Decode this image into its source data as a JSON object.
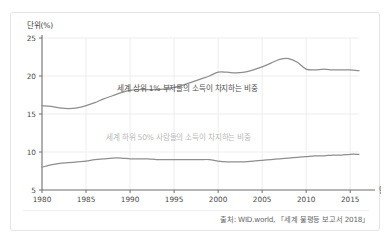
{
  "figure": {
    "unit_y_label": "단위(%)",
    "unit_x_label": "단위(년)",
    "source": "출처: WID.world, 「세계 불평등 보고서 2018」",
    "line_color": "#8e8e8e",
    "grid_color": "#ededed",
    "axis_color": "#6f6f6f",
    "border_color": "#e3e3e3",
    "annotation_top_color": "#4f4f4f",
    "annotation_bottom_color": "#b9b9b9"
  },
  "chart_data": {
    "type": "line",
    "title": "",
    "xlabel": "단위(년)",
    "ylabel": "단위(%)",
    "xlim": [
      1980,
      2016
    ],
    "ylim": [
      5,
      25
    ],
    "yticks": [
      5,
      10,
      15,
      20,
      25
    ],
    "xticks": [
      1980,
      1985,
      1990,
      1995,
      2000,
      2005,
      2010,
      2015
    ],
    "grid": true,
    "legend": "annotations-inline",
    "x": [
      1980,
      1981,
      1982,
      1983,
      1984,
      1985,
      1986,
      1987,
      1988,
      1989,
      1990,
      1991,
      1992,
      1993,
      1994,
      1995,
      1996,
      1997,
      1998,
      1999,
      2000,
      2001,
      2002,
      2003,
      2004,
      2005,
      2006,
      2007,
      2008,
      2009,
      2010,
      2011,
      2012,
      2013,
      2014,
      2015,
      2016
    ],
    "series": [
      {
        "name": "세계 상위 1% 부자들의 소득이 차지하는 비중",
        "values": [
          16.1,
          16.0,
          15.8,
          15.7,
          15.8,
          16.1,
          16.5,
          17.0,
          17.4,
          17.8,
          18.1,
          18.2,
          18.2,
          18.2,
          18.3,
          18.5,
          18.8,
          19.2,
          19.6,
          20.0,
          20.5,
          20.5,
          20.4,
          20.5,
          20.8,
          21.2,
          21.7,
          22.2,
          22.3,
          21.8,
          20.9,
          20.8,
          20.9,
          20.8,
          20.8,
          20.8,
          20.7
        ]
      },
      {
        "name": "세계 하위 50% 사람들의 소득이 차지하는 비중",
        "values": [
          8.0,
          8.3,
          8.5,
          8.6,
          8.7,
          8.8,
          9.0,
          9.1,
          9.2,
          9.2,
          9.1,
          9.1,
          9.1,
          9.0,
          9.0,
          9.0,
          9.0,
          9.0,
          9.0,
          9.0,
          8.8,
          8.7,
          8.7,
          8.7,
          8.8,
          8.9,
          9.0,
          9.1,
          9.2,
          9.3,
          9.4,
          9.5,
          9.5,
          9.6,
          9.6,
          9.7,
          9.7
        ]
      }
    ],
    "annotations": [
      {
        "text": "세계 상위 1% 부자들의 소득이 차지하는 비중",
        "x": 1996.5,
        "y": 18.0
      },
      {
        "text": "세계 하위 50% 사람들의 소득이 차지하는 비중",
        "x": 1995.5,
        "y": 11.6
      }
    ]
  }
}
